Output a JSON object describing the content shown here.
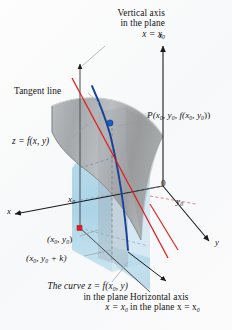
{
  "figure": {
    "background": "#fbfbfc"
  },
  "colors": {
    "surface_gray": "#9a9a9a",
    "plane_blue": "#a8d4e8",
    "curve_blue": "#1c4fa0",
    "tangent_red": "#e01b1b",
    "point_blue": "#1a5fc0",
    "point_red": "#e02020",
    "axis_black": "#1a1a1a",
    "leader_gray": "#8c8c8c",
    "dashed_red": "#d06060"
  },
  "labels": {
    "vertical_axis_line1": "Vertical axis",
    "vertical_axis_line2": "in the plane",
    "vertical_axis_line3": "x = x",
    "vertical_axis_sub": "0",
    "z_axis": "z",
    "tangent_line": "Tangent line",
    "point_P_prefix": "P(x",
    "point_P_s1": "0",
    "point_P_mid1": ", y",
    "point_P_s2": "0",
    "point_P_mid2": ", f(x",
    "point_P_s3": "0",
    "point_P_mid3": ", y",
    "point_P_s4": "0",
    "point_P_suffix": "))",
    "surface_eq": "z = f(x, y)",
    "origin": "0",
    "y_zero": "y",
    "y_zero_sub": "0",
    "x_zero": "x",
    "x_zero_sub": "0",
    "x_axis": "x",
    "y_axis": "y",
    "point_xy": "(x",
    "point_xy_s1": "0",
    "point_xy_mid": ", y",
    "point_xy_s2": "0",
    "point_xy_end": ")",
    "point_xyk": "(x",
    "point_xyk_s1": "0",
    "point_xyk_mid": ", y",
    "point_xyk_s2": "0",
    "point_xyk_end": " + k)",
    "curve_line1_a": "The curve z = f(x",
    "curve_line1_sub": "0",
    "curve_line1_b": ", y)",
    "curve_line2": "in the plane",
    "curve_line3": "x = x",
    "curve_line3_sub": "0",
    "horizontal_line1": "Horizontal axis",
    "horizontal_line2_a": "in the plane x = x",
    "horizontal_line2_sub": "0"
  },
  "geometry": {
    "z_axis": {
      "x": 163,
      "y_top": 44,
      "y_bottom": 186
    },
    "y_axis": {
      "x1": 163,
      "y1": 186,
      "x2": 211,
      "y2": 243
    },
    "x_axis": {
      "x1": 163,
      "y1": 186,
      "x2": 13,
      "y2": 215
    },
    "vertical_in_plane": {
      "x": 80,
      "y_top": 62,
      "y_bottom": 225
    },
    "point_P": {
      "x": 110,
      "y": 123
    },
    "point_base": {
      "x": 80,
      "y": 228
    }
  }
}
